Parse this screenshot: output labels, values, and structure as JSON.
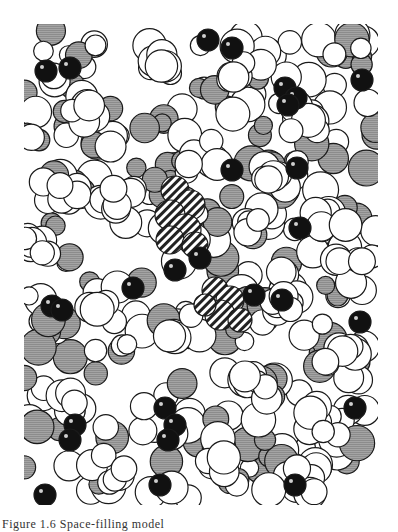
{
  "figure": {
    "bounds": {
      "x": 24,
      "y": 24,
      "w": 354,
      "h": 481
    },
    "colors": {
      "white_atom": "#ffffff",
      "gray_atom": "#9a9a9a",
      "black_atom": "#111111",
      "outline": "#1a1a1a",
      "highlight": "#cfcfcf",
      "hatch": "#222222"
    },
    "legend": [
      {
        "kind": "white",
        "meaning": "white atoms"
      },
      {
        "kind": "gray",
        "meaning": "gray-shaded atoms"
      },
      {
        "kind": "black",
        "meaning": "black atoms"
      },
      {
        "kind": "hatched",
        "meaning": "hatched region (highlighted site)"
      }
    ]
  },
  "caption": {
    "text": "Figure 1.6  Space-filling model"
  }
}
